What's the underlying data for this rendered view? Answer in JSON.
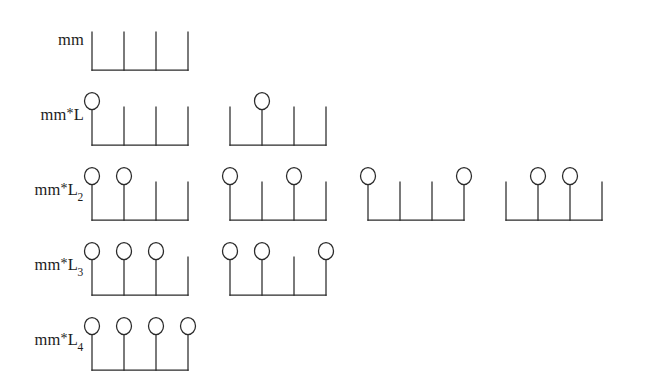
{
  "figure": {
    "background_color": "#ffffff",
    "ink_color": "#2a2a2a",
    "tine_count": 4,
    "rows": [
      {
        "id": "row-mm",
        "label_base": "mm",
        "label_star": "",
        "label_sub": "",
        "label_text": "mm",
        "marked_count": 0,
        "combs": [
          {
            "id": "comb-mm-1",
            "marks": []
          }
        ]
      },
      {
        "id": "row-mm-L",
        "label_base": "mm",
        "label_star": "*",
        "label_mid": "L",
        "label_sub": "",
        "label_text": "mm*L",
        "marked_count": 1,
        "combs": [
          {
            "id": "comb-mmL-1",
            "marks": [
              1
            ]
          },
          {
            "id": "comb-mmL-2",
            "marks": [
              2
            ]
          }
        ]
      },
      {
        "id": "row-mm-L2",
        "label_base": "mm",
        "label_star": "*",
        "label_mid": "L",
        "label_sub": "2",
        "label_text": "mm*L2",
        "marked_count": 2,
        "combs": [
          {
            "id": "comb-mmL2-1",
            "marks": [
              1,
              2
            ]
          },
          {
            "id": "comb-mmL2-2",
            "marks": [
              1,
              3
            ]
          },
          {
            "id": "comb-mmL2-3",
            "marks": [
              1,
              4
            ]
          },
          {
            "id": "comb-mmL2-4",
            "marks": [
              2,
              3
            ]
          }
        ]
      },
      {
        "id": "row-mm-L3",
        "label_base": "mm",
        "label_star": "*",
        "label_mid": "L",
        "label_sub": "3",
        "label_text": "mm*L3",
        "marked_count": 3,
        "combs": [
          {
            "id": "comb-mmL3-1",
            "marks": [
              1,
              2,
              3
            ]
          },
          {
            "id": "comb-mmL3-2",
            "marks": [
              1,
              2,
              4
            ]
          }
        ]
      },
      {
        "id": "row-mm-L4",
        "label_base": "mm",
        "label_star": "*",
        "label_mid": "L",
        "label_sub": "4",
        "label_text": "mm*L4",
        "marked_count": 4,
        "combs": [
          {
            "id": "comb-mmL4-1",
            "marks": [
              1,
              2,
              3,
              4
            ]
          }
        ]
      }
    ]
  },
  "geometry": {
    "row_tops": [
      8,
      83,
      158,
      233,
      308
    ],
    "label_tops": [
      30,
      105,
      180,
      255,
      330
    ],
    "comb_width": 116,
    "comb_gap": 22,
    "tine_spacing": 32,
    "tine_top": 24,
    "baseline_y": 62,
    "circle_cy": 18,
    "circle_r": 7.5,
    "left_margin": 88
  }
}
